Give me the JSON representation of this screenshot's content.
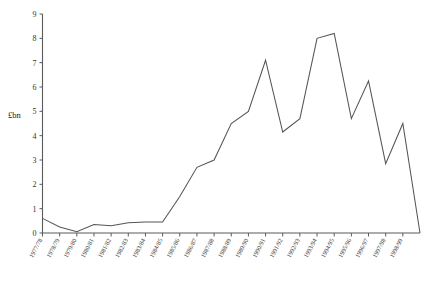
{
  "chart_data": {
    "type": "line",
    "title": "",
    "xlabel": "",
    "ylabel": "£bn",
    "ylim": [
      0,
      9
    ],
    "yticks": [
      0,
      1,
      2,
      3,
      4,
      5,
      6,
      7,
      8,
      9
    ],
    "grid": false,
    "legend": null,
    "categories": [
      "1977/78",
      "1978/79",
      "1979/80",
      "1980/81",
      "1981/82",
      "1982/83",
      "1983/84",
      "1984/85",
      "1985/86",
      "1986/87",
      "1987/88",
      "1988/89",
      "1989/90",
      "1990/91",
      "1991/92",
      "1992/93",
      "1993/94",
      "1994/95",
      "1995/96",
      "1996/97",
      "1997/98",
      "1998/99"
    ],
    "values": [
      0.6,
      0.25,
      0.05,
      0.35,
      0.3,
      0.42,
      0.45,
      0.45,
      1.5,
      2.7,
      3.0,
      4.5,
      5.0,
      7.1,
      4.15,
      4.7,
      8.0,
      8.2,
      4.7,
      6.25,
      2.85,
      4.5
    ],
    "values_tail_endpoint": 0.0,
    "series_name": ""
  }
}
